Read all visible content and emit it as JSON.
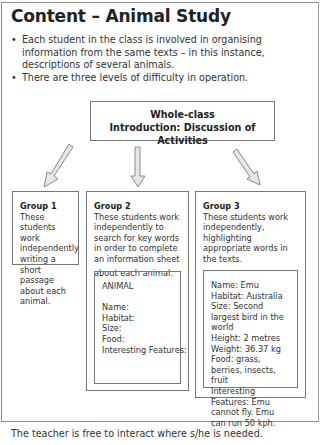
{
  "page": {
    "title": "Content – Animal Study",
    "bullets": [
      "Each student in the class is involved in organising information from the same texts – in this instance, descriptions of several animals.",
      "There are three levels of difficulty in operation."
    ],
    "intro_box": {
      "line1": "Whole-class",
      "line2": "Introduction:  Discussion of Activities"
    },
    "groups": [
      {
        "title": "Group 1",
        "description": "These students work independently writing a short passage about each animal."
      },
      {
        "title": "Group 2",
        "description": "These students work independently to search for key words in order to complete an information sheet",
        "description_tail": "about each animal.",
        "sheet": {
          "heading": "ANIMAL",
          "fields": [
            "Name:",
            "Habitat:",
            "Size:",
            "Food:",
            "Interesting Features:"
          ]
        }
      },
      {
        "title": "Group 3",
        "description": "These students work independently, highlighting appropriate words in the texts.",
        "sheet": {
          "lines": [
            "Name:  Emu",
            "Habitat:  Australia",
            "Size:  Second largest bird in the world",
            "Height:  2 metres",
            "Weight:  36.37 kg",
            "Food:  grass, berries, insects, fruit",
            "Interesting Features: Emu cannot fly.  Emu can run 50 kph."
          ]
        }
      }
    ],
    "footer": "The teacher is free to interact where s/he is needed.",
    "icons": {
      "arrow_left": "diagonal-down-left-arrow",
      "arrow_center": "down-arrow",
      "arrow_right": "diagonal-down-right-arrow"
    },
    "colors": {
      "border": "#777777",
      "arrow_fill": "#e6e6e6",
      "arrow_stroke": "#8a8a8a",
      "text": "#333333"
    }
  }
}
